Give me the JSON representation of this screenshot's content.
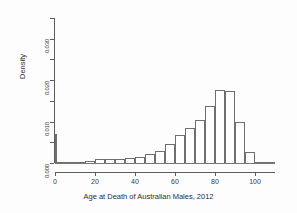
{
  "figure": {
    "background": "#fdfdfd",
    "axis_color": "#5d5d5d",
    "bar_border_color": "#6f6f6f",
    "bar_fill_color": "#ffffff"
  },
  "chart_data": {
    "type": "bar",
    "title": "",
    "xlabel": "Age at Death of Australian Males, 2012",
    "ylabel": "Density",
    "xlim": [
      0,
      110
    ],
    "ylim": [
      0,
      0.035
    ],
    "grid": false,
    "legend": null,
    "xticks": [
      0,
      20,
      40,
      60,
      80,
      100
    ],
    "xtick_labels": [
      "0",
      "20",
      "40",
      "60",
      "80",
      "100"
    ],
    "xticks_minor": [
      10,
      30,
      50,
      70,
      90,
      110
    ],
    "yticks": [
      0.0,
      0.01,
      0.02,
      0.03
    ],
    "ytick_labels": [
      "0.000",
      "0.010",
      "0.020",
      "0.030"
    ],
    "yticks_minor": [
      0.005,
      0.015,
      0.025,
      0.035
    ],
    "bin_width": 5,
    "bins": [
      {
        "x0": 0,
        "x1": 1,
        "value": 0.007
      },
      {
        "x0": 1,
        "x1": 5,
        "value": 0.0002
      },
      {
        "x0": 5,
        "x1": 10,
        "value": 0.0001
      },
      {
        "x0": 10,
        "x1": 15,
        "value": 0.0001
      },
      {
        "x0": 15,
        "x1": 20,
        "value": 0.0006
      },
      {
        "x0": 20,
        "x1": 25,
        "value": 0.0009
      },
      {
        "x0": 25,
        "x1": 30,
        "value": 0.001
      },
      {
        "x0": 30,
        "x1": 35,
        "value": 0.001
      },
      {
        "x0": 35,
        "x1": 40,
        "value": 0.0011
      },
      {
        "x0": 40,
        "x1": 45,
        "value": 0.0014
      },
      {
        "x0": 45,
        "x1": 50,
        "value": 0.0022
      },
      {
        "x0": 50,
        "x1": 55,
        "value": 0.003
      },
      {
        "x0": 55,
        "x1": 60,
        "value": 0.0047
      },
      {
        "x0": 60,
        "x1": 65,
        "value": 0.0067
      },
      {
        "x0": 65,
        "x1": 70,
        "value": 0.0085
      },
      {
        "x0": 70,
        "x1": 75,
        "value": 0.0103
      },
      {
        "x0": 75,
        "x1": 80,
        "value": 0.0137
      },
      {
        "x0": 80,
        "x1": 85,
        "value": 0.0176
      },
      {
        "x0": 85,
        "x1": 90,
        "value": 0.0174
      },
      {
        "x0": 90,
        "x1": 95,
        "value": 0.01
      },
      {
        "x0": 95,
        "x1": 100,
        "value": 0.0026
      },
      {
        "x0": 100,
        "x1": 110,
        "value": 0.0001
      }
    ]
  }
}
